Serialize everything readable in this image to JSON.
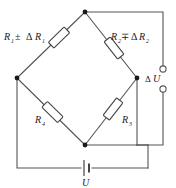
{
  "diagram": {
    "type": "circuit-schematic",
    "colors": {
      "wire": "#555555",
      "node": "#1a1a1a",
      "resistor_fill": "#ffffff",
      "resistor_stroke": "#444444",
      "text": "#222222",
      "background": "#ffffff"
    },
    "components": {
      "r1": {
        "name": "R1",
        "label_base": "R",
        "label_sub": "1",
        "operator": "±",
        "delta": "Δ",
        "delta_base": "R",
        "delta_sub": "1",
        "full_label": "R₁ ± ΔR₁",
        "position": "top-left"
      },
      "r2": {
        "name": "R2",
        "label_base": "R",
        "label_sub": "2",
        "operator": "∓",
        "delta": "Δ",
        "delta_base": "R",
        "delta_sub": "2",
        "full_label": "R₂ ∓ ΔR₂",
        "position": "top-right"
      },
      "r3": {
        "name": "R3",
        "label_base": "R",
        "label_sub": "3",
        "full_label": "R₃",
        "position": "bottom-right"
      },
      "r4": {
        "name": "R4",
        "label_base": "R",
        "label_sub": "4",
        "full_label": "R₄",
        "position": "bottom-left"
      },
      "source": {
        "name": "battery",
        "label": "U",
        "position": "bottom"
      },
      "output": {
        "name": "output-terminals",
        "delta": "Δ",
        "label_base": "U",
        "full_label": "ΔU",
        "terminal_count": 2,
        "position": "right"
      }
    },
    "nodes": {
      "top": "node-top",
      "left": "node-left",
      "right": "node-right",
      "bottom": "node-bottom"
    }
  }
}
